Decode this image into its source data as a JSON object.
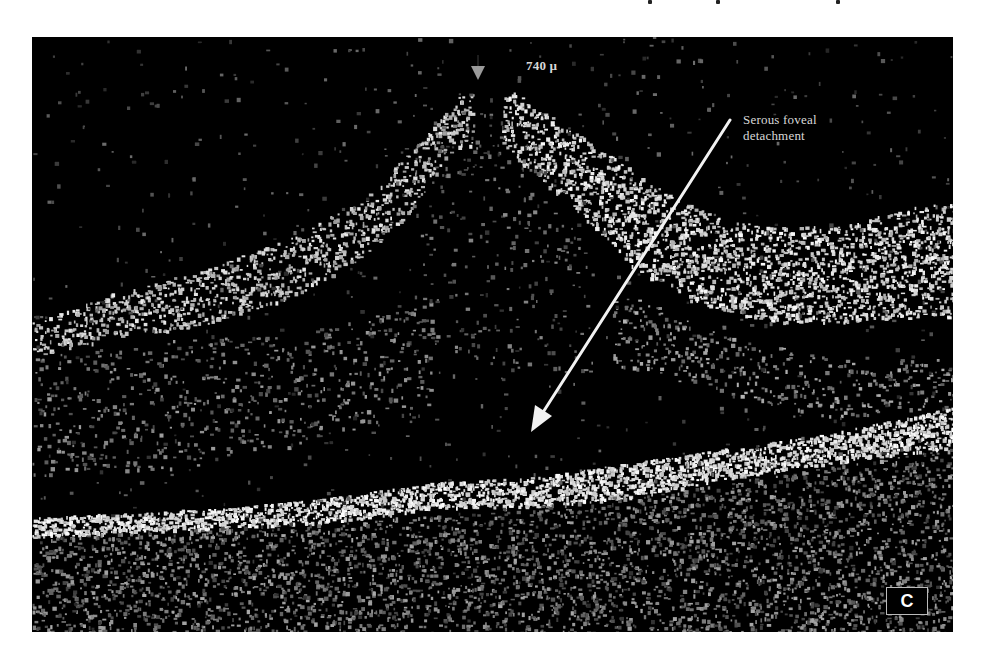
{
  "figure": {
    "type": "OCT retinal cross-section scan",
    "background_color": "#000000",
    "speckle_color": "#e6e6e6",
    "marker_color": "#9a9a9a",
    "annotations": {
      "thickness": "740 µ",
      "finding_line1": "Serous foveal",
      "finding_line2": "detachment"
    },
    "panel_label": "C",
    "arrow": {
      "from": [
        730,
        120
      ],
      "to": [
        531,
        430
      ],
      "color": "#f2f2f2"
    },
    "marker": {
      "shape": "down-triangle",
      "position": [
        478,
        73
      ]
    }
  }
}
